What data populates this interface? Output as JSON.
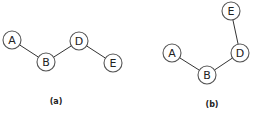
{
  "diagrams": [
    {
      "id": "a",
      "caption": "(a)",
      "caption_pos": [
        56,
        104
      ],
      "nodes": [
        {
          "label": "A",
          "x": 12,
          "y": 40
        },
        {
          "label": "B",
          "x": 46,
          "y": 62
        },
        {
          "label": "D",
          "x": 79,
          "y": 41
        },
        {
          "label": "E",
          "x": 113,
          "y": 63
        }
      ],
      "edges": [
        [
          "A",
          "B"
        ],
        [
          "B",
          "D"
        ],
        [
          "D",
          "E"
        ]
      ]
    },
    {
      "id": "b",
      "caption": "(b)",
      "caption_pos": [
        212,
        107
      ],
      "nodes": [
        {
          "label": "A",
          "x": 172,
          "y": 53
        },
        {
          "label": "B",
          "x": 207,
          "y": 75
        },
        {
          "label": "D",
          "x": 240,
          "y": 53
        },
        {
          "label": "E",
          "x": 231,
          "y": 11
        }
      ],
      "edges": [
        [
          "A",
          "B"
        ],
        [
          "B",
          "D"
        ],
        [
          "D",
          "E"
        ]
      ]
    }
  ],
  "node_radius": 9,
  "colors": {
    "edge": "#333333",
    "node_stroke": "#555555",
    "node_fill": "#ffffff",
    "text": "#222222"
  }
}
